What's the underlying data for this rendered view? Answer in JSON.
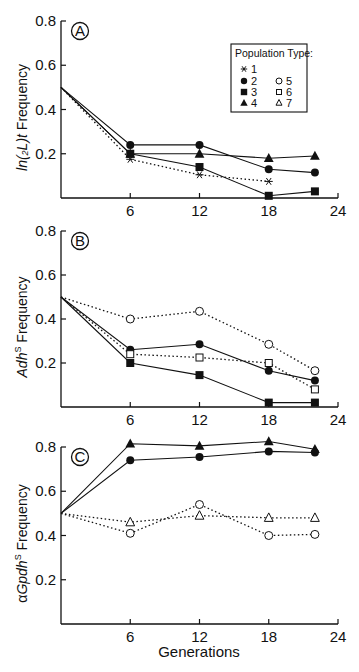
{
  "chart_data": [
    {
      "type": "line",
      "panel": "A",
      "ylabel": "ln(2L)t Frequency",
      "ylabel_parts": {
        "italic": "ln(",
        "sub": "2",
        "italic2": "L)t",
        "rest": " Frequency"
      },
      "xlabel": "",
      "x_ticks": [
        6,
        12,
        18,
        24
      ],
      "y_ticks": [
        0.2,
        0.4,
        0.6,
        0.8
      ],
      "xlim": [
        0,
        24
      ],
      "ylim": [
        0,
        0.8
      ],
      "grid": false,
      "legend": {
        "title": "Population Type:",
        "position": "upper right",
        "entries": [
          {
            "label": "1",
            "marker": "asterisk"
          },
          {
            "label": "2",
            "marker": "filled-circle"
          },
          {
            "label": "3",
            "marker": "filled-square"
          },
          {
            "label": "4",
            "marker": "filled-triangle"
          },
          {
            "label": "5",
            "marker": "open-circle"
          },
          {
            "label": "6",
            "marker": "open-square"
          },
          {
            "label": "7",
            "marker": "open-triangle"
          }
        ]
      },
      "series": [
        {
          "name": "2",
          "marker": "filled-circle",
          "line": "solid",
          "x": [
            0,
            6,
            12,
            18,
            22
          ],
          "values": [
            0.5,
            0.24,
            0.24,
            0.13,
            0.115
          ]
        },
        {
          "name": "4",
          "marker": "filled-triangle",
          "line": "solid",
          "x": [
            0,
            6,
            12,
            18,
            22
          ],
          "values": [
            0.5,
            0.2,
            0.2,
            0.18,
            0.19
          ]
        },
        {
          "name": "3",
          "marker": "filled-square",
          "line": "solid",
          "x": [
            0,
            6,
            12,
            18,
            22
          ],
          "values": [
            0.5,
            0.2,
            0.14,
            0.01,
            0.03
          ]
        },
        {
          "name": "1",
          "marker": "asterisk",
          "line": "dotted",
          "x": [
            0,
            6,
            12,
            18
          ],
          "values": [
            0.5,
            0.175,
            0.105,
            0.075
          ]
        }
      ]
    },
    {
      "type": "line",
      "panel": "B",
      "ylabel": "AdhS Frequency",
      "ylabel_parts": {
        "italic": "Adh",
        "sup": "S",
        "rest": " Frequency"
      },
      "xlabel": "",
      "x_ticks": [
        6,
        12,
        18,
        24
      ],
      "y_ticks": [
        0.2,
        0.4,
        0.6,
        0.8
      ],
      "xlim": [
        0,
        24
      ],
      "ylim": [
        0,
        0.8
      ],
      "grid": false,
      "series": [
        {
          "name": "5",
          "marker": "open-circle",
          "line": "dotted",
          "x": [
            0,
            6,
            12,
            18,
            22
          ],
          "values": [
            0.5,
            0.4,
            0.435,
            0.285,
            0.165
          ]
        },
        {
          "name": "2",
          "marker": "filled-circle",
          "line": "solid",
          "x": [
            0,
            6,
            12,
            18,
            22
          ],
          "values": [
            0.5,
            0.26,
            0.285,
            0.165,
            0.12
          ]
        },
        {
          "name": "6",
          "marker": "open-square",
          "line": "dotted",
          "x": [
            0,
            6,
            12,
            18,
            22
          ],
          "values": [
            0.5,
            0.24,
            0.225,
            0.2,
            0.08
          ]
        },
        {
          "name": "3",
          "marker": "filled-square",
          "line": "solid",
          "x": [
            0,
            6,
            12,
            18,
            22
          ],
          "values": [
            0.5,
            0.2,
            0.145,
            0.02,
            0.02
          ]
        }
      ]
    },
    {
      "type": "line",
      "panel": "C",
      "ylabel": "αGpdhS Frequency",
      "ylabel_parts": {
        "prefix": "α",
        "italic": "Gpdh",
        "sup": "S",
        "rest": " Frequency"
      },
      "xlabel": "Generations",
      "x_ticks": [
        6,
        12,
        18,
        24
      ],
      "y_ticks": [
        0.2,
        0.4,
        0.6,
        0.8
      ],
      "xlim": [
        0,
        24
      ],
      "ylim": [
        0,
        0.8
      ],
      "grid": false,
      "series": [
        {
          "name": "4",
          "marker": "filled-triangle",
          "line": "solid",
          "x": [
            0,
            6,
            12,
            18,
            22
          ],
          "values": [
            0.5,
            0.815,
            0.805,
            0.825,
            0.79
          ]
        },
        {
          "name": "2",
          "marker": "filled-circle",
          "line": "solid",
          "x": [
            0,
            6,
            12,
            18,
            22
          ],
          "values": [
            0.5,
            0.74,
            0.755,
            0.78,
            0.775
          ]
        },
        {
          "name": "7",
          "marker": "open-triangle",
          "line": "dotted",
          "x": [
            0,
            6,
            12,
            18,
            22
          ],
          "values": [
            0.5,
            0.46,
            0.49,
            0.48,
            0.48
          ]
        },
        {
          "name": "5",
          "marker": "open-circle",
          "line": "dotted",
          "x": [
            0,
            6,
            12,
            18,
            22
          ],
          "values": [
            0.5,
            0.41,
            0.54,
            0.4,
            0.405
          ]
        }
      ]
    }
  ],
  "panels": [
    {
      "letter": "A",
      "y_tick_labels": [
        "0.2",
        "0.4",
        "0.6",
        "0.8"
      ],
      "x_tick_labels": [
        "6",
        "12",
        "18",
        "24"
      ]
    },
    {
      "letter": "B",
      "y_tick_labels": [
        "0.2",
        "0.4",
        "0.6",
        "0.8"
      ],
      "x_tick_labels": [
        "6",
        "12",
        "18",
        "24"
      ]
    },
    {
      "letter": "C",
      "y_tick_labels": [
        "0.2",
        "0.4",
        "0.6",
        "0.8"
      ],
      "x_tick_labels": [
        "6",
        "12",
        "18",
        "24"
      ]
    }
  ],
  "xlabel": "Generations",
  "colors": {
    "ink": "#111111",
    "background": "#ffffff"
  }
}
